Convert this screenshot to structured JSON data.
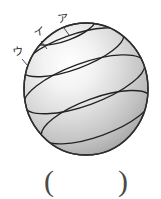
{
  "figure": {
    "name": "shaded-sphere-with-latitude-bands",
    "colors": {
      "highlight": "#fdfdfd",
      "midtone": "#d2d2d2",
      "shadow": "#8e8e8e",
      "outline": "#2e2e2e",
      "band_line": "#222222",
      "background": "#ffffff",
      "label_text": "#2b2b2b",
      "paren_text": "#4a4a4a"
    },
    "geometry": {
      "center_x": 86,
      "center_y": 89,
      "radius_x": 62,
      "radius_y": 66,
      "band_tilt_degrees": -20,
      "band_count": 4
    },
    "labels": [
      {
        "id": "a",
        "text": "ア",
        "x": 57,
        "y": 13
      },
      {
        "id": "i",
        "text": "イ",
        "x": 33,
        "y": 26
      },
      {
        "id": "u",
        "text": "ウ",
        "x": 12,
        "y": 46
      }
    ]
  },
  "answer_field": {
    "open_paren": "(",
    "close_paren": ")",
    "value": ""
  }
}
